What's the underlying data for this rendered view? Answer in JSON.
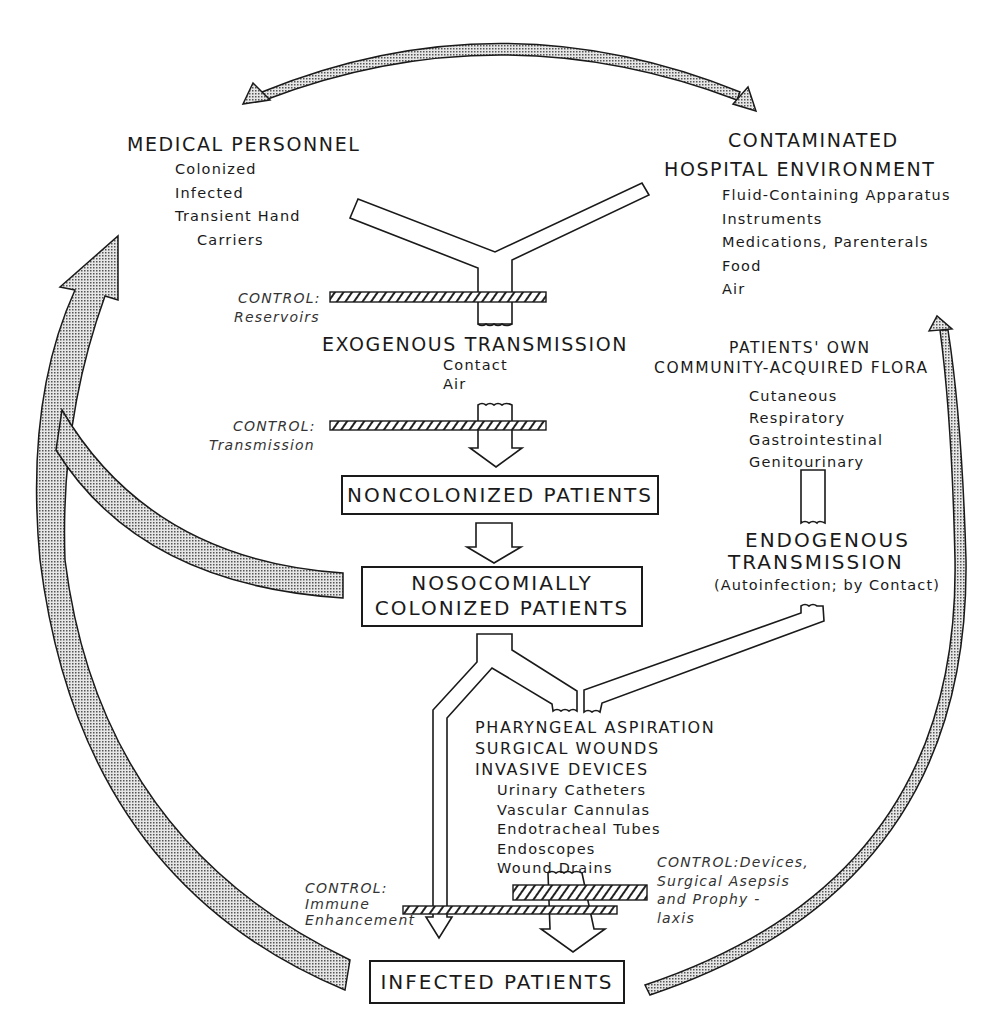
{
  "diagram": {
    "type": "nosocomial-infection-transmission-cycle",
    "colors": {
      "ink": "#1a1a1a",
      "stipple_fill": "#bdbdbd",
      "background": "#ffffff"
    },
    "nodes": {
      "medical_personnel": {
        "title": "MEDICAL PERSONNEL",
        "items": [
          "Colonized",
          "Infected",
          "Transient Hand",
          "Carriers"
        ]
      },
      "hospital_environment": {
        "title_line1": "CONTAMINATED",
        "title_line2": "HOSPITAL ENVIRONMENT",
        "items": [
          "Fluid-Containing Apparatus",
          "Instruments",
          "Medications, Parenterals",
          "Food",
          "Air"
        ]
      },
      "exogenous_transmission": {
        "title": "EXOGENOUS TRANSMISSION",
        "items": [
          "Contact",
          "Air"
        ]
      },
      "patients_own_flora": {
        "title_line1": "PATIENTS' OWN",
        "title_line2": "COMMUNITY-ACQUIRED FLORA",
        "items": [
          "Cutaneous",
          "Respiratory",
          "Gastrointestinal",
          "Genitourinary"
        ]
      },
      "endogenous_transmission": {
        "title_line1": "ENDOGENOUS",
        "title_line2": "TRANSMISSION",
        "subtitle": "(Autoinfection; by Contact)"
      },
      "noncolonized_patients": {
        "label": "NONCOLONIZED PATIENTS"
      },
      "nosocomially_colonized_patients": {
        "line1": "NOSOCOMIALLY",
        "line2": "COLONIZED PATIENTS"
      },
      "portals": {
        "titles": [
          "PHARYNGEAL ASPIRATION",
          "SURGICAL WOUNDS",
          "INVASIVE DEVICES"
        ],
        "devices": [
          "Urinary Catheters",
          "Vascular Cannulas",
          "Endotracheal Tubes",
          "Endoscopes",
          "Wound Drains"
        ]
      },
      "infected_patients": {
        "label": "INFECTED PATIENTS"
      }
    },
    "controls": {
      "reservoirs": {
        "line1": "CONTROL:",
        "line2": "Reservoirs"
      },
      "transmission": {
        "line1": "CONTROL:",
        "line2": "Transmission"
      },
      "immune": {
        "line1": "CONTROL:",
        "line2": "Immune",
        "line3": "Enhancement"
      },
      "devices": {
        "line1": "CONTROL:Devices,",
        "line2": "Surgical Asepsis",
        "line3": "and Prophy -",
        "line4": "laxis"
      }
    },
    "arrows": [
      {
        "from": "medical_personnel",
        "to": "hospital_environment",
        "style": "stippled-double-headed"
      },
      {
        "from": "nosocomially_colonized_patients",
        "to": "medical_personnel",
        "style": "stippled"
      },
      {
        "from": "infected_patients",
        "to": "medical_personnel",
        "style": "stippled"
      },
      {
        "from": "infected_patients",
        "to": "hospital_environment",
        "style": "stippled"
      }
    ]
  }
}
